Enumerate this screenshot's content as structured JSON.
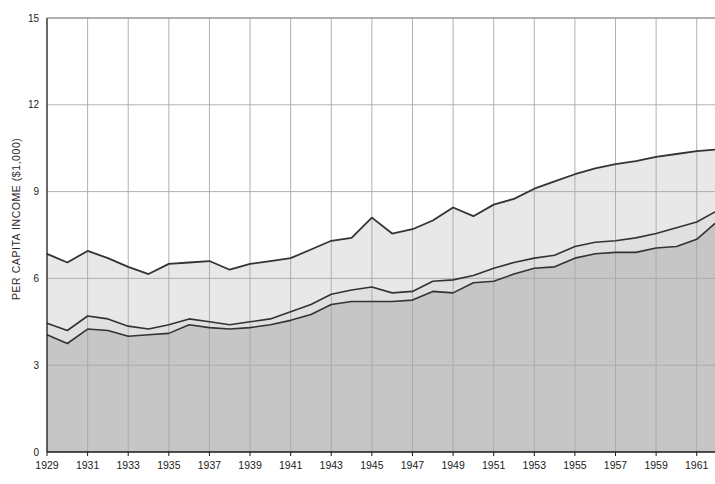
{
  "chart_data": {
    "type": "area",
    "title": "",
    "subtitle": "",
    "xlabel": "",
    "ylabel": "PER CAPITA INCOME ($1,000)",
    "stacked": true,
    "grid": true,
    "legend_position": "none",
    "xlim": [
      1929,
      1961.9
    ],
    "ylim": [
      0,
      15
    ],
    "yticks": [
      0,
      3,
      6,
      9,
      12,
      15
    ],
    "ytick_labels": [
      "0",
      "3",
      "6",
      "9",
      "12",
      "15"
    ],
    "xticks": [
      1929,
      1931,
      1933,
      1935,
      1937,
      1939,
      1941,
      1943,
      1945,
      1947,
      1949,
      1951,
      1953,
      1955,
      1957,
      1959,
      1961
    ],
    "xtick_labels": [
      "1929",
      "1931",
      "1933",
      "1935",
      "1937",
      "1939",
      "1941",
      "1943",
      "1945",
      "1947",
      "1949",
      "1951",
      "1953",
      "1955",
      "1957",
      "1959",
      "1961"
    ],
    "x": [
      1929,
      1930,
      1931,
      1932,
      1933,
      1934,
      1935,
      1936,
      1937,
      1938,
      1939,
      1940,
      1941,
      1942,
      1943,
      1944,
      1945,
      1946,
      1947,
      1948,
      1949,
      1950,
      1951,
      1952,
      1953,
      1954,
      1955,
      1956,
      1957,
      1958,
      1959,
      1960,
      1961,
      1961.9
    ],
    "series": [
      {
        "name": "lower-band-upper-boundary",
        "color": "#c6c6c6",
        "values": [
          4.05,
          3.75,
          4.25,
          4.2,
          4.0,
          4.05,
          4.1,
          4.4,
          4.3,
          4.25,
          4.3,
          4.4,
          4.55,
          4.75,
          5.1,
          5.2,
          5.2,
          5.2,
          5.25,
          5.55,
          5.5,
          5.85,
          5.9,
          6.15,
          6.35,
          6.4,
          6.7,
          6.85,
          6.9,
          6.9,
          7.05,
          7.1,
          7.35,
          7.9
        ]
      },
      {
        "name": "middle-band-upper-boundary",
        "color": "#e0e0e0",
        "values": [
          4.45,
          4.2,
          4.7,
          4.6,
          4.35,
          4.25,
          4.4,
          4.6,
          4.5,
          4.4,
          4.5,
          4.6,
          4.85,
          5.1,
          5.45,
          5.6,
          5.7,
          5.5,
          5.55,
          5.9,
          5.95,
          6.1,
          6.35,
          6.55,
          6.7,
          6.8,
          7.1,
          7.25,
          7.3,
          7.4,
          7.55,
          7.75,
          7.95,
          8.3
        ]
      },
      {
        "name": "upper-band-upper-boundary",
        "color": "#e8e8e8",
        "values": [
          6.85,
          6.55,
          6.95,
          6.7,
          6.4,
          6.15,
          6.5,
          6.55,
          6.6,
          6.3,
          6.5,
          6.6,
          6.7,
          7.0,
          7.3,
          7.4,
          8.1,
          7.55,
          7.7,
          8.0,
          8.45,
          8.15,
          8.55,
          8.75,
          9.1,
          9.35,
          9.6,
          9.8,
          9.95,
          10.05,
          10.2,
          10.3,
          10.4,
          10.45
        ]
      }
    ]
  },
  "style": {
    "grid_color": "#a8a8a8",
    "axis_color": "#1a1a1a",
    "line_color": "#333333",
    "band_lower_fill": "#c6c6c6",
    "band_middle_fill": "#e0e0e0",
    "band_upper_fill": "#e8e8e8",
    "background": "#ffffff"
  },
  "plot_geometry": {
    "left": 47,
    "right": 715,
    "top": 18,
    "bottom": 452
  }
}
